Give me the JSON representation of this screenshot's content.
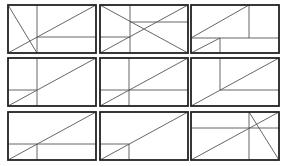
{
  "diagram": {
    "title": "",
    "rows": 3,
    "cols": 3,
    "box_width": 88,
    "box_height": 48,
    "colors": {
      "frame": "#222222",
      "lines": "#555555",
      "background": "#ffffff"
    },
    "panels": [
      {
        "id": 1,
        "x": 8,
        "y": 5,
        "lines": [
          [
            29,
            0,
            29,
            48
          ],
          [
            29,
            32,
            88,
            32
          ],
          [
            0,
            48,
            88,
            0
          ],
          [
            0,
            0,
            29,
            48
          ]
        ]
      },
      {
        "id": 2,
        "x": 100,
        "y": 5,
        "lines": [
          [
            30,
            0,
            30,
            48
          ],
          [
            30,
            17,
            88,
            17
          ],
          [
            0,
            32,
            30,
            32
          ],
          [
            0,
            0,
            88,
            48
          ],
          [
            0,
            48,
            88,
            0
          ]
        ]
      },
      {
        "id": 3,
        "x": 191,
        "y": 5,
        "lines": [
          [
            58,
            0,
            58,
            33
          ],
          [
            0,
            33,
            88,
            33
          ],
          [
            29,
            33,
            29,
            48
          ],
          [
            0,
            33,
            58,
            0
          ],
          [
            0,
            48,
            29,
            33
          ]
        ]
      },
      {
        "id": 4,
        "x": 8,
        "y": 58,
        "lines": [
          [
            29,
            0,
            29,
            48
          ],
          [
            0,
            32,
            29,
            32
          ],
          [
            0,
            48,
            88,
            0
          ]
        ]
      },
      {
        "id": 5,
        "x": 100,
        "y": 58,
        "lines": [
          [
            29,
            0,
            29,
            48
          ],
          [
            0,
            32,
            88,
            32
          ],
          [
            0,
            48,
            88,
            0
          ]
        ]
      },
      {
        "id": 6,
        "x": 191,
        "y": 58,
        "lines": [
          [
            29,
            0,
            29,
            32
          ],
          [
            29,
            32,
            88,
            32
          ],
          [
            0,
            48,
            88,
            0
          ]
        ]
      },
      {
        "id": 7,
        "x": 8,
        "y": 112,
        "lines": [
          [
            0,
            32,
            88,
            32
          ],
          [
            29,
            32,
            29,
            48
          ],
          [
            0,
            48,
            88,
            0
          ]
        ]
      },
      {
        "id": 8,
        "x": 100,
        "y": 112,
        "lines": [
          [
            0,
            32,
            29,
            32
          ],
          [
            29,
            32,
            29,
            48
          ],
          [
            0,
            48,
            88,
            0
          ]
        ]
      },
      {
        "id": 9,
        "x": 191,
        "y": 112,
        "lines": [
          [
            0,
            16,
            88,
            16
          ],
          [
            58,
            0,
            58,
            48
          ],
          [
            0,
            48,
            88,
            0
          ],
          [
            58,
            0,
            88,
            48
          ]
        ]
      }
    ]
  }
}
